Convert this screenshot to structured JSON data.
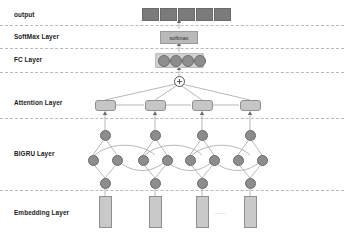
{
  "diagram": {
    "colors": {
      "node_fill": "#8d8d8d",
      "node_stroke": "#6a6a6a",
      "box_fill": "#c6c6c6",
      "box_stroke": "#8f8f8f",
      "output_fill": "#7b7b7b",
      "softmax_fill": "#b9b9b9",
      "embedding_fill": "#c9c9c9",
      "divider": "#b9b9b9",
      "wire": "#9a9a9a",
      "text": "#1a1a1a"
    }
  },
  "layers": [
    {
      "id": "output",
      "label": "output"
    },
    {
      "id": "softmax",
      "label": "SoftMax Layer"
    },
    {
      "id": "fc",
      "label": "FC Layer"
    },
    {
      "id": "attention",
      "label": "Attention Layer"
    },
    {
      "id": "bigru",
      "label": "BIGRU Layer"
    },
    {
      "id": "embedding",
      "label": "Embedding Layer"
    }
  ],
  "output_row": {
    "count": 5,
    "boxes": [
      {
        "label": ""
      },
      {
        "label": ""
      },
      {
        "label": ""
      },
      {
        "label": ""
      },
      {
        "label": ""
      }
    ]
  },
  "softmax": {
    "label": "softmax"
  },
  "fc_layer": {
    "node_count": 4
  },
  "sum_node": {
    "symbol": "+"
  },
  "attention_layer": {
    "box_count": 4
  },
  "bigru_layer": {
    "top_row_count": 4,
    "middle_row_count": 8,
    "bottom_row_count": 4,
    "directions": "bidirectional"
  },
  "embedding_layer": {
    "box_count": 4,
    "ellipsis": "......"
  }
}
